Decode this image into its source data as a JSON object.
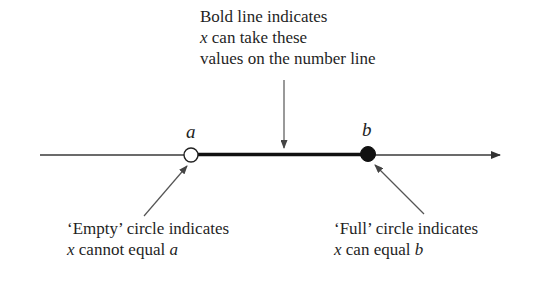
{
  "top_note": {
    "line1": "Bold line indicates",
    "line2_var": "x",
    "line2_rest": " can take these",
    "line3": "values on the number line"
  },
  "points": {
    "a": {
      "label": "a",
      "style": "empty"
    },
    "b": {
      "label": "b",
      "style": "full"
    }
  },
  "left_note": {
    "line1": "‘Empty’ circle indicates",
    "line2_var": "x",
    "line2_rest": " cannot equal ",
    "line2_end_var": "a"
  },
  "right_note": {
    "line1": "‘Full’ circle indicates",
    "line2_var": "x",
    "line2_rest": " can equal ",
    "line2_end_var": "b"
  },
  "colors": {
    "line": "#3a3a3a",
    "bold_line": "#111111",
    "arrow": "#444444"
  }
}
